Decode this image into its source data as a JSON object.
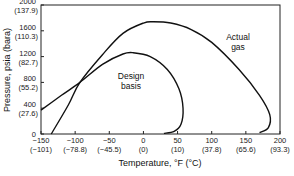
{
  "chart_data": {
    "type": "line",
    "title": "",
    "xlabel": "Temperature, °F (°C)",
    "ylabel": "Pressure, psia (bara)",
    "xlim": [
      -150,
      200
    ],
    "ylim": [
      0,
      2000
    ],
    "grid": false,
    "x_ticks": [
      {
        "f": "−150",
        "c": "(−101)"
      },
      {
        "f": "−100",
        "c": "(−78.8)"
      },
      {
        "f": "−50",
        "c": "(−45.5)"
      },
      {
        "f": "0",
        "c": "(0)"
      },
      {
        "f": "50",
        "c": "(10)"
      },
      {
        "f": "100",
        "c": "(37.8)"
      },
      {
        "f": "150",
        "c": "(65.6)"
      },
      {
        "f": "200",
        "c": "(93.3)"
      }
    ],
    "y_ticks": [
      {
        "psia": "0",
        "bara": ""
      },
      {
        "psia": "400",
        "bara": "(27.6)"
      },
      {
        "psia": "800",
        "bara": "(55.2)"
      },
      {
        "psia": "1200",
        "bara": "(82.7)"
      },
      {
        "psia": "1600",
        "bara": "(110.3)"
      },
      {
        "psia": "2000",
        "bara": "(137.9)"
      }
    ],
    "series": [
      {
        "name": "Actual gas",
        "x": [
          -135,
          -110,
          -93,
          -60,
          -30,
          0,
          15,
          40,
          70,
          100,
          140,
          170,
          185,
          183,
          170
        ],
        "y": [
          0,
          450,
          800,
          1230,
          1560,
          1720,
          1740,
          1720,
          1620,
          1420,
          1000,
          600,
          300,
          100,
          20
        ]
      },
      {
        "name": "Design basis",
        "x": [
          -150,
          -120,
          -93,
          -60,
          -30,
          -15,
          10,
          35,
          52,
          58,
          55,
          45,
          30
        ],
        "y": [
          370,
          600,
          800,
          1080,
          1240,
          1260,
          1200,
          1000,
          700,
          400,
          150,
          40,
          10
        ]
      }
    ],
    "annotations": [
      {
        "text": "Actual\ngas",
        "x": 130,
        "y": 1450
      },
      {
        "text": "Design\nbasis",
        "x": -30,
        "y": 850
      }
    ]
  },
  "labels": {
    "xlabel": "Temperature, °F (°C)",
    "ylabel": "Pressure, psia (bara)",
    "actual_1": "Actual",
    "actual_2": "gas",
    "design_1": "Design",
    "design_2": "basis"
  }
}
